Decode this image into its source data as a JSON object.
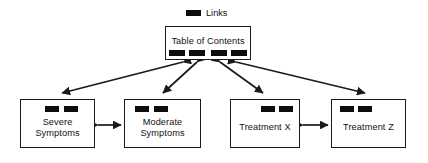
{
  "figure": {
    "type": "node-link-diagram",
    "background_color": "#ffffff",
    "line_color": "#1a1a1a",
    "link_bar_color": "#0d0d0d"
  },
  "legend": {
    "swatch_name": "link-bar-swatch",
    "label": "Links"
  },
  "nodes": [
    {
      "id": "toc",
      "label": "Table of Contents",
      "role": "hub",
      "link_bars": 4,
      "bar_widths": [
        16,
        16,
        16,
        16
      ],
      "bar_gaps": [
        4,
        6,
        4
      ],
      "x": 165,
      "y": 26,
      "width": 86,
      "height": 34
    },
    {
      "id": "severe",
      "label": "Severe\nSymptoms",
      "role": "content",
      "link_bars": 2,
      "bar_widths": [
        14,
        14
      ],
      "bar_gaps": [
        5
      ],
      "x": 20,
      "y": 99,
      "width": 75,
      "height": 49
    },
    {
      "id": "moderate",
      "label": "Moderate\nSymptoms",
      "role": "content",
      "link_bars": 2,
      "bar_widths": [
        14,
        14
      ],
      "bar_gaps": [
        5
      ],
      "x": 124,
      "y": 99,
      "width": 77,
      "height": 49
    },
    {
      "id": "treatment-x",
      "label": "Treatment X",
      "role": "content",
      "link_bars": 2,
      "bar_widths": [
        14,
        14
      ],
      "bar_gaps": [
        4
      ],
      "x": 230,
      "y": 99,
      "width": 70,
      "height": 49
    },
    {
      "id": "treatment-z",
      "label": "Treatment Z",
      "role": "content",
      "link_bars": 2,
      "bar_widths": [
        14,
        14
      ],
      "bar_gaps": [
        4
      ],
      "x": 331,
      "y": 99,
      "width": 75,
      "height": 49
    }
  ],
  "connectors": [
    {
      "id": "toc-severe",
      "from": "toc",
      "to": "severe",
      "arrow": "double",
      "orientation": "diagonal"
    },
    {
      "id": "toc-moderate",
      "from": "toc",
      "to": "moderate",
      "arrow": "double",
      "orientation": "diagonal"
    },
    {
      "id": "toc-treatment-x",
      "from": "toc",
      "to": "treatment-x",
      "arrow": "double",
      "orientation": "diagonal"
    },
    {
      "id": "toc-treatment-z",
      "from": "toc",
      "to": "treatment-z",
      "arrow": "double",
      "orientation": "diagonal"
    },
    {
      "id": "severe-moderate",
      "from": "severe",
      "to": "moderate",
      "arrow": "double",
      "orientation": "horizontal"
    },
    {
      "id": "treatment-x-z",
      "from": "treatment-x",
      "to": "treatment-z",
      "arrow": "double",
      "orientation": "horizontal"
    }
  ]
}
